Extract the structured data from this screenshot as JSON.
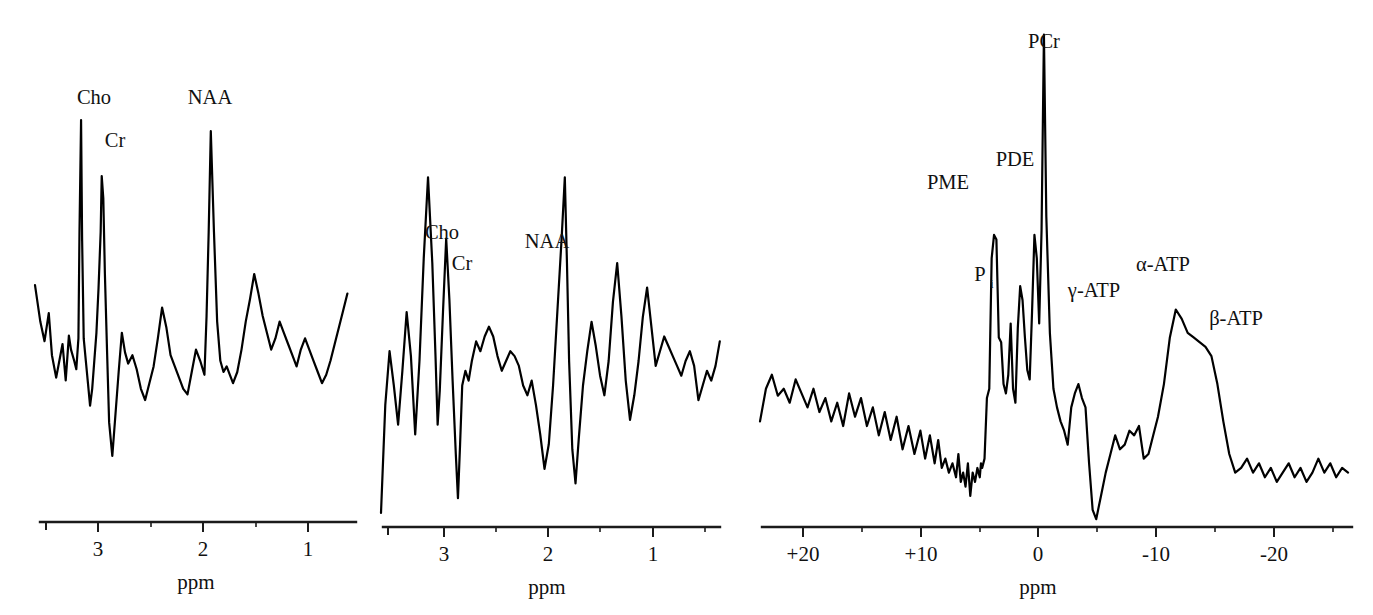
{
  "figure": {
    "background_color": "#ffffff",
    "trace_color": "#000000",
    "axis_color": "#1b1b1b"
  },
  "chart_data": [
    {
      "id": "panel-1",
      "type": "line",
      "title": "",
      "xlabel": "ppm",
      "ylabel": "",
      "xlim": [
        3.65,
        0.6
      ],
      "x_axis_reversed": true,
      "grid": false,
      "legend": false,
      "tick_labels": [
        "3",
        "2",
        "1"
      ],
      "tick_values": [
        3,
        2,
        1
      ],
      "minor_tick_values": [
        3.5,
        2.5,
        1.5,
        0.5
      ],
      "annotations": [
        {
          "text": "Cho",
          "ppm": 3.21,
          "note": "choline peak, tallest"
        },
        {
          "text": "Cr",
          "ppm": 3.02,
          "note": "creatine peak"
        },
        {
          "text": "NAA",
          "ppm": 2.01,
          "note": "N-acetylaspartate peak"
        }
      ],
      "x": [
        3.65,
        3.6,
        3.56,
        3.52,
        3.49,
        3.45,
        3.42,
        3.39,
        3.36,
        3.33,
        3.31,
        3.28,
        3.26,
        3.24,
        3.23,
        3.215,
        3.205,
        3.19,
        3.17,
        3.15,
        3.13,
        3.11,
        3.09,
        3.07,
        3.05,
        3.03,
        3.02,
        3.005,
        2.99,
        2.97,
        2.95,
        2.92,
        2.89,
        2.86,
        2.83,
        2.8,
        2.77,
        2.73,
        2.69,
        2.65,
        2.61,
        2.57,
        2.53,
        2.49,
        2.45,
        2.41,
        2.37,
        2.33,
        2.29,
        2.25,
        2.21,
        2.17,
        2.13,
        2.09,
        2.05,
        2.03,
        2.01,
        1.99,
        1.96,
        1.93,
        1.9,
        1.87,
        1.84,
        1.81,
        1.78,
        1.74,
        1.7,
        1.66,
        1.62,
        1.58,
        1.54,
        1.5,
        1.46,
        1.42,
        1.38,
        1.34,
        1.3,
        1.26,
        1.22,
        1.18,
        1.14,
        1.1,
        1.06,
        1.02,
        0.98,
        0.94,
        0.9,
        0.86,
        0.82,
        0.78,
        0.74,
        0.7,
        0.66,
        0.62
      ],
      "y": [
        41,
        28,
        21,
        31,
        16,
        8,
        14,
        20,
        7,
        23,
        18,
        14,
        11,
        22,
        60,
        100,
        57,
        22,
        14,
        6,
        -2,
        4,
        14,
        24,
        40,
        60,
        80,
        72,
        45,
        18,
        -8,
        -20,
        -5,
        10,
        24,
        17,
        13,
        16,
        11,
        4,
        0,
        6,
        12,
        22,
        33,
        26,
        16,
        12,
        8,
        4,
        2,
        10,
        18,
        14,
        9,
        30,
        60,
        96,
        60,
        28,
        14,
        10,
        12,
        9,
        6,
        10,
        18,
        28,
        36,
        45,
        38,
        30,
        24,
        18,
        22,
        28,
        24,
        20,
        16,
        12,
        18,
        22,
        18,
        14,
        10,
        6,
        9,
        14,
        20,
        26,
        32,
        38
      ]
    },
    {
      "id": "panel-2",
      "type": "line",
      "title": "",
      "xlabel": "ppm",
      "ylabel": "",
      "xlim": [
        3.75,
        0.55
      ],
      "x_axis_reversed": true,
      "grid": false,
      "legend": false,
      "tick_labels": [
        "3",
        "2",
        "1"
      ],
      "tick_values": [
        3,
        2,
        1
      ],
      "minor_tick_values": [
        3.5,
        2.5,
        1.5,
        0.5
      ],
      "annotations": [
        {
          "text": "Cho",
          "ppm": 3.22,
          "note": "choline peak, tallest"
        },
        {
          "text": "Cr",
          "ppm": 3.02,
          "note": "creatine peak"
        },
        {
          "text": "NAA",
          "ppm": 2.01,
          "note": "N-acetylaspartate peak"
        }
      ],
      "x": [
        3.75,
        3.71,
        3.67,
        3.63,
        3.59,
        3.55,
        3.51,
        3.47,
        3.43,
        3.39,
        3.35,
        3.31,
        3.27,
        3.24,
        3.22,
        3.2,
        3.17,
        3.14,
        3.11,
        3.08,
        3.05,
        3.03,
        3.01,
        2.99,
        2.96,
        2.93,
        2.9,
        2.86,
        2.82,
        2.78,
        2.74,
        2.7,
        2.66,
        2.62,
        2.58,
        2.54,
        2.5,
        2.46,
        2.42,
        2.38,
        2.34,
        2.3,
        2.26,
        2.22,
        2.18,
        2.14,
        2.1,
        2.06,
        2.03,
        2.01,
        1.99,
        1.96,
        1.93,
        1.9,
        1.86,
        1.82,
        1.78,
        1.74,
        1.7,
        1.66,
        1.62,
        1.58,
        1.54,
        1.5,
        1.46,
        1.42,
        1.38,
        1.34,
        1.3,
        1.26,
        1.22,
        1.18,
        1.14,
        1.1,
        1.06,
        1.02,
        0.98,
        0.94,
        0.9,
        0.86,
        0.82,
        0.78,
        0.74,
        0.7,
        0.66,
        0.62,
        0.58
      ],
      "y": [
        -42,
        2,
        24,
        10,
        -6,
        16,
        40,
        22,
        -10,
        20,
        62,
        95,
        60,
        22,
        -6,
        8,
        40,
        70,
        45,
        12,
        -18,
        -36,
        -14,
        10,
        16,
        12,
        20,
        28,
        24,
        30,
        34,
        30,
        22,
        16,
        20,
        24,
        22,
        18,
        10,
        6,
        12,
        2,
        -10,
        -24,
        -14,
        10,
        40,
        70,
        95,
        60,
        20,
        -16,
        -30,
        -12,
        10,
        24,
        36,
        26,
        14,
        6,
        20,
        44,
        60,
        38,
        12,
        -4,
        6,
        20,
        38,
        50,
        34,
        18,
        24,
        30,
        26,
        22,
        18,
        14,
        20,
        24,
        18,
        4,
        10,
        16,
        12,
        18,
        28
      ]
    },
    {
      "id": "panel-3",
      "type": "line",
      "title": "",
      "xlabel": "ppm",
      "ylabel": "",
      "xlim": [
        23.5,
        -26.5
      ],
      "x_axis_reversed": true,
      "grid": false,
      "legend": false,
      "tick_labels": [
        "+20",
        "+10",
        "0",
        "-10",
        "-20"
      ],
      "tick_values": [
        20,
        10,
        0,
        -10,
        -20
      ],
      "minor_tick_values": [
        15,
        5,
        -5,
        -15,
        -25
      ],
      "annotations": [
        {
          "text": "PME",
          "ppm": 6.6,
          "note": "phosphomonoesters"
        },
        {
          "text": "Pi",
          "ppm": 4.9,
          "note": "inorganic phosphate (P subscript i)"
        },
        {
          "text": "PDE",
          "ppm": 2.6,
          "note": "phosphodiesters"
        },
        {
          "text": "PCr",
          "ppm": 0.0,
          "note": "phosphocreatine, tallest peak"
        },
        {
          "text": "γ-ATP",
          "ppm": -2.6,
          "note": "gamma ATP"
        },
        {
          "text": "α-ATP",
          "ppm": -7.6,
          "note": "alpha ATP"
        },
        {
          "text": "β-ATP",
          "ppm": -16.2,
          "note": "beta ATP"
        }
      ],
      "x": [
        23.5,
        23.0,
        22.5,
        22.0,
        21.5,
        21.0,
        20.5,
        20.0,
        19.5,
        19.0,
        18.5,
        18.0,
        17.5,
        17.0,
        16.5,
        16.0,
        15.5,
        15.0,
        14.5,
        14.0,
        13.5,
        13.0,
        12.5,
        12.0,
        11.5,
        11.0,
        10.5,
        10.0,
        9.6,
        9.2,
        8.8,
        8.5,
        8.2,
        7.9,
        7.6,
        7.3,
        7.0,
        6.8,
        6.6,
        6.4,
        6.2,
        6.0,
        5.8,
        5.6,
        5.4,
        5.2,
        5.0,
        4.9,
        4.8,
        4.6,
        4.4,
        4.2,
        4.0,
        3.8,
        3.6,
        3.4,
        3.2,
        3.0,
        2.8,
        2.6,
        2.4,
        2.2,
        2.0,
        1.8,
        1.6,
        1.4,
        1.2,
        1.0,
        0.8,
        0.6,
        0.4,
        0.2,
        0.0,
        -0.2,
        -0.4,
        -0.6,
        -0.9,
        -1.2,
        -1.5,
        -1.8,
        -2.1,
        -2.4,
        -2.7,
        -3.0,
        -3.3,
        -3.6,
        -3.9,
        -4.2,
        -4.5,
        -4.8,
        -5.2,
        -5.6,
        -6.0,
        -6.4,
        -6.8,
        -7.2,
        -7.6,
        -8.0,
        -8.4,
        -8.8,
        -9.2,
        -9.6,
        -10.0,
        -10.5,
        -11.0,
        -11.5,
        -12.0,
        -12.5,
        -13.0,
        -13.5,
        -14.0,
        -14.5,
        -15.0,
        -15.5,
        -16.0,
        -16.5,
        -17.0,
        -17.5,
        -18.0,
        -18.5,
        -19.0,
        -19.5,
        -20.0,
        -20.5,
        -21.0,
        -21.5,
        -22.0,
        -22.5,
        -23.0,
        -23.5,
        -24.0,
        -24.5,
        -25.0,
        -25.5,
        -26.0,
        -26.5
      ],
      "y": [
        8,
        22,
        28,
        19,
        22,
        16,
        26,
        20,
        14,
        22,
        12,
        18,
        8,
        16,
        6,
        20,
        10,
        18,
        6,
        14,
        2,
        12,
        0,
        10,
        -4,
        6,
        -6,
        4,
        -8,
        2,
        -10,
        0,
        -12,
        -8,
        -14,
        -10,
        -16,
        -6,
        -18,
        -14,
        -20,
        -10,
        -24,
        -14,
        -18,
        -12,
        -16,
        -10,
        -12,
        -8,
        18,
        22,
        78,
        88,
        86,
        44,
        42,
        24,
        20,
        28,
        50,
        22,
        16,
        48,
        66,
        60,
        44,
        30,
        26,
        55,
        88,
        78,
        50,
        90,
        174,
        96,
        46,
        22,
        14,
        8,
        4,
        -2,
        14,
        20,
        24,
        18,
        14,
        -10,
        -30,
        -34,
        -24,
        -14,
        -6,
        2,
        -4,
        -2,
        4,
        2,
        6,
        -8,
        -6,
        2,
        10,
        24,
        44,
        56,
        52,
        46,
        44,
        42,
        40,
        36,
        24,
        8,
        -6,
        -14,
        -12,
        -8,
        -14,
        -10,
        -16,
        -12,
        -18,
        -14,
        -10,
        -16,
        -12,
        -18,
        -14,
        -8,
        -14,
        -10,
        -16,
        -12,
        -14
      ]
    }
  ],
  "panels": [
    {
      "id": "panel-1",
      "peak_labels": [
        "Cho",
        "Cr",
        "NAA"
      ],
      "axis_title": "ppm",
      "tick_labels": [
        "3",
        "2",
        "1"
      ]
    },
    {
      "id": "panel-2",
      "peak_labels": [
        "Cho",
        "Cr",
        "NAA"
      ],
      "axis_title": "ppm",
      "tick_labels": [
        "3",
        "2",
        "1"
      ]
    },
    {
      "id": "panel-3",
      "peak_labels": [
        "PME",
        "P",
        "i",
        "PDE",
        "PCr",
        "γ-ATP",
        "α-ATP",
        "β-ATP"
      ],
      "axis_title": "ppm",
      "tick_labels": [
        "+20",
        "+10",
        "0",
        "-10",
        "-20"
      ]
    }
  ],
  "labels": {
    "p1": {
      "cho": "Cho",
      "cr": "Cr",
      "naa": "NAA",
      "ppm": "ppm",
      "t3": "3",
      "t2": "2",
      "t1": "1"
    },
    "p2": {
      "cho": "Cho",
      "cr": "Cr",
      "naa": "NAA",
      "ppm": "ppm",
      "t3": "3",
      "t2": "2",
      "t1": "1"
    },
    "p3": {
      "pme": "PME",
      "pi_base": "P",
      "pi_sub": "i",
      "pde": "PDE",
      "pcr": "PCr",
      "gatp": "γ-ATP",
      "aatp": "α-ATP",
      "batp": "β-ATP",
      "ppm": "ppm",
      "t_p20": "+20",
      "t_p10": "+10",
      "t_0": "0",
      "t_m10": "-10",
      "t_m20": "-20"
    }
  }
}
